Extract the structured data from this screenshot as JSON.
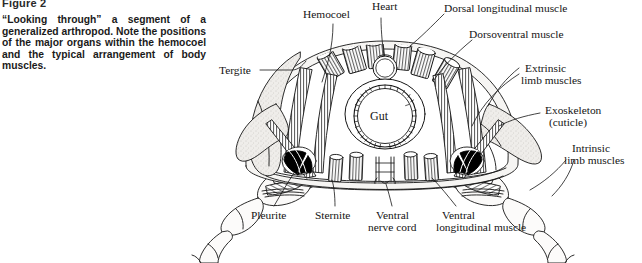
{
  "figure": {
    "number": "Figure 2",
    "caption": "“Looking through” a segment of a generalized arthropod. Note the positions of the major organs within the hemocoel and the typical arrangement of body muscles."
  },
  "diagram": {
    "ink_color": "#141414",
    "fill_color": "#ffffff",
    "shading_color": "#e8e6e2",
    "dark_muscle_color": "#000000",
    "labels": {
      "hemocoel": "Hemocoel",
      "heart": "Heart",
      "dorsal_longitudinal_muscle": "Dorsal longitudinal muscle",
      "dorsoventral_muscle": "Dorsoventral muscle",
      "extrinsic_limb_muscles_line1": "Extrinsic",
      "extrinsic_limb_muscles_line2": "limb muscles",
      "exoskeleton_line1": "Exoskeleton",
      "exoskeleton_line2": "(cuticle)",
      "intrinsic_limb_muscles_line1": "Intrinsic",
      "intrinsic_limb_muscles_line2": "limb muscles",
      "tergite": "Tergite",
      "gut": "Gut",
      "pleurite": "Pleurite",
      "sternite": "Sternite",
      "ventral_nerve_cord_line1": "Ventral",
      "ventral_nerve_cord_line2": "nerve cord",
      "ventral_longitudinal_muscle_line1": "Ventral",
      "ventral_longitudinal_muscle_line2": "longitudinal muscle"
    }
  }
}
